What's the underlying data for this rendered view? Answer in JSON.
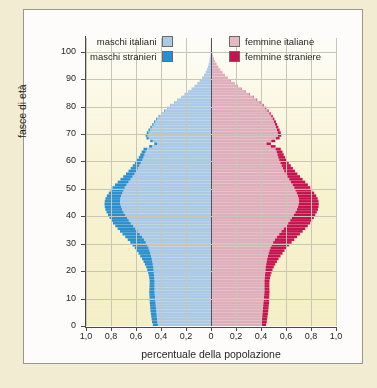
{
  "chart_data": {
    "type": "bar",
    "orientation": "horizontal",
    "subtype": "population-pyramid",
    "title": "",
    "xlabel": "percentuale della popolazione",
    "ylabel": "fasce di età",
    "xtick_labels": [
      "1,0",
      "0,8",
      "0,6",
      "0,4",
      "0,2",
      "0",
      "0,2",
      "0,4",
      "0,6",
      "0,8",
      "1,0"
    ],
    "xtick_values": [
      -1.0,
      -0.8,
      -0.6,
      -0.4,
      -0.2,
      0,
      0.2,
      0.4,
      0.6,
      0.8,
      1.0
    ],
    "ytick_labels": [
      "0",
      "10",
      "20",
      "30",
      "40",
      "50",
      "60",
      "70",
      "80",
      "90",
      "100"
    ],
    "ytick_values": [
      0,
      10,
      20,
      30,
      40,
      50,
      60,
      70,
      80,
      90,
      100
    ],
    "xlim": [
      -1.0,
      1.0
    ],
    "ylim": [
      0,
      105
    ],
    "grid": true,
    "legend_position": "top",
    "ages": [
      0,
      1,
      2,
      3,
      4,
      5,
      6,
      7,
      8,
      9,
      10,
      11,
      12,
      13,
      14,
      15,
      16,
      17,
      18,
      19,
      20,
      21,
      22,
      23,
      24,
      25,
      26,
      27,
      28,
      29,
      30,
      31,
      32,
      33,
      34,
      35,
      36,
      37,
      38,
      39,
      40,
      41,
      42,
      43,
      44,
      45,
      46,
      47,
      48,
      49,
      50,
      51,
      52,
      53,
      54,
      55,
      56,
      57,
      58,
      59,
      60,
      61,
      62,
      63,
      64,
      65,
      66,
      67,
      68,
      69,
      70,
      71,
      72,
      73,
      74,
      75,
      76,
      77,
      78,
      79,
      80,
      81,
      82,
      83,
      84,
      85,
      86,
      87,
      88,
      89,
      90,
      91,
      92,
      93,
      94,
      95,
      96,
      97,
      98,
      99,
      100,
      101,
      102,
      103,
      104
    ],
    "series": [
      {
        "name": "maschi italiani",
        "side": "left",
        "color": "#a9c9e6",
        "values": [
          0.425,
          0.43,
          0.432,
          0.434,
          0.436,
          0.438,
          0.44,
          0.442,
          0.444,
          0.446,
          0.448,
          0.45,
          0.452,
          0.452,
          0.452,
          0.452,
          0.452,
          0.454,
          0.456,
          0.458,
          0.46,
          0.462,
          0.466,
          0.47,
          0.474,
          0.48,
          0.486,
          0.492,
          0.5,
          0.51,
          0.522,
          0.536,
          0.552,
          0.57,
          0.588,
          0.606,
          0.624,
          0.642,
          0.658,
          0.672,
          0.686,
          0.7,
          0.712,
          0.72,
          0.726,
          0.728,
          0.726,
          0.72,
          0.71,
          0.7,
          0.69,
          0.676,
          0.66,
          0.644,
          0.628,
          0.612,
          0.598,
          0.586,
          0.574,
          0.562,
          0.55,
          0.54,
          0.532,
          0.524,
          0.512,
          0.47,
          0.432,
          0.466,
          0.498,
          0.508,
          0.5,
          0.488,
          0.474,
          0.46,
          0.446,
          0.43,
          0.412,
          0.392,
          0.37,
          0.346,
          0.32,
          0.292,
          0.264,
          0.236,
          0.208,
          0.18,
          0.154,
          0.13,
          0.108,
          0.088,
          0.07,
          0.055,
          0.042,
          0.032,
          0.024,
          0.018,
          0.013,
          0.009,
          0.006,
          0.004,
          0.003,
          0.002,
          0.0015,
          0.001,
          0.0006
        ]
      },
      {
        "name": "maschi stranieri",
        "side": "left",
        "color": "#2a8fd0",
        "values": [
          0.04,
          0.042,
          0.043,
          0.044,
          0.045,
          0.046,
          0.046,
          0.046,
          0.046,
          0.045,
          0.044,
          0.043,
          0.042,
          0.041,
          0.04,
          0.039,
          0.039,
          0.04,
          0.042,
          0.045,
          0.05,
          0.056,
          0.063,
          0.07,
          0.078,
          0.086,
          0.094,
          0.102,
          0.11,
          0.118,
          0.124,
          0.13,
          0.134,
          0.138,
          0.14,
          0.141,
          0.142,
          0.142,
          0.141,
          0.14,
          0.138,
          0.136,
          0.133,
          0.13,
          0.126,
          0.122,
          0.118,
          0.113,
          0.108,
          0.103,
          0.098,
          0.092,
          0.086,
          0.08,
          0.074,
          0.068,
          0.062,
          0.057,
          0.052,
          0.047,
          0.042,
          0.038,
          0.034,
          0.031,
          0.028,
          0.025,
          0.022,
          0.02,
          0.018,
          0.016,
          0.014,
          0.012,
          0.011,
          0.01,
          0.009,
          0.008,
          0.007,
          0.006,
          0.005,
          0.004,
          0.004,
          0.003,
          0.003,
          0.002,
          0.002,
          0.002,
          0.001,
          0.001,
          0.001,
          0.001,
          0.001,
          0.001,
          0.0005,
          0.0005,
          0.0004,
          0.0003,
          0.0002,
          0.0002,
          0.0001,
          0.0001,
          0.0001,
          0.0001,
          0.0001,
          0.0001,
          0.0001
        ]
      },
      {
        "name": "femmine italiane",
        "side": "right",
        "color": "#dfaebd",
        "values": [
          0.402,
          0.406,
          0.408,
          0.41,
          0.412,
          0.414,
          0.416,
          0.418,
          0.42,
          0.422,
          0.424,
          0.426,
          0.428,
          0.428,
          0.428,
          0.428,
          0.428,
          0.43,
          0.432,
          0.434,
          0.436,
          0.438,
          0.442,
          0.446,
          0.45,
          0.456,
          0.462,
          0.468,
          0.476,
          0.486,
          0.498,
          0.512,
          0.528,
          0.546,
          0.564,
          0.582,
          0.6,
          0.618,
          0.634,
          0.648,
          0.662,
          0.676,
          0.688,
          0.696,
          0.702,
          0.704,
          0.702,
          0.696,
          0.686,
          0.676,
          0.666,
          0.654,
          0.64,
          0.626,
          0.612,
          0.598,
          0.586,
          0.576,
          0.566,
          0.556,
          0.546,
          0.538,
          0.532,
          0.526,
          0.516,
          0.478,
          0.444,
          0.482,
          0.52,
          0.536,
          0.534,
          0.528,
          0.52,
          0.512,
          0.504,
          0.494,
          0.482,
          0.468,
          0.452,
          0.434,
          0.414,
          0.39,
          0.364,
          0.336,
          0.306,
          0.274,
          0.244,
          0.214,
          0.186,
          0.158,
          0.132,
          0.11,
          0.09,
          0.072,
          0.056,
          0.043,
          0.032,
          0.023,
          0.016,
          0.011,
          0.008,
          0.005,
          0.0035,
          0.002,
          0.0012
        ]
      },
      {
        "name": "femmine straniere",
        "side": "right",
        "color": "#c5134f",
        "values": [
          0.038,
          0.04,
          0.041,
          0.042,
          0.043,
          0.044,
          0.044,
          0.044,
          0.044,
          0.043,
          0.042,
          0.041,
          0.04,
          0.039,
          0.039,
          0.039,
          0.04,
          0.042,
          0.045,
          0.05,
          0.056,
          0.064,
          0.072,
          0.081,
          0.09,
          0.1,
          0.11,
          0.12,
          0.13,
          0.139,
          0.147,
          0.154,
          0.16,
          0.165,
          0.169,
          0.172,
          0.174,
          0.175,
          0.175,
          0.174,
          0.172,
          0.17,
          0.167,
          0.164,
          0.16,
          0.156,
          0.151,
          0.146,
          0.14,
          0.134,
          0.128,
          0.121,
          0.114,
          0.107,
          0.1,
          0.093,
          0.086,
          0.079,
          0.072,
          0.066,
          0.06,
          0.055,
          0.05,
          0.046,
          0.042,
          0.038,
          0.035,
          0.032,
          0.029,
          0.026,
          0.024,
          0.021,
          0.019,
          0.017,
          0.015,
          0.013,
          0.012,
          0.01,
          0.009,
          0.008,
          0.007,
          0.006,
          0.005,
          0.004,
          0.004,
          0.003,
          0.003,
          0.002,
          0.002,
          0.002,
          0.001,
          0.001,
          0.001,
          0.001,
          0.0008,
          0.0006,
          0.0004,
          0.0003,
          0.0002,
          0.0002,
          0.0001,
          0.0001,
          0.0001,
          0.0001,
          0.0001
        ]
      }
    ]
  },
  "axes": {
    "y_title": "fasce di età",
    "x_title": "percentuale della popolazione",
    "y_labels": [
      "100",
      "90",
      "80",
      "70",
      "60",
      "50",
      "40",
      "30",
      "20",
      "10",
      "0"
    ],
    "x_labels": [
      "1,0",
      "0,8",
      "0,6",
      "0,4",
      "0,2",
      "0",
      "0,2",
      "0,4",
      "0,6",
      "0,8",
      "1,0"
    ]
  },
  "legend": {
    "left": [
      {
        "label": "maschi italiani",
        "color": "#a9c9e6"
      },
      {
        "label": "maschi stranieri",
        "color": "#2a8fd0"
      }
    ],
    "right": [
      {
        "label": "femmine italiane",
        "color": "#e5b9c6"
      },
      {
        "label": "femmine straniere",
        "color": "#c5134f"
      }
    ]
  },
  "colors": {
    "page_background": "#f2ecd2",
    "card_background": "#fdfcfa",
    "plot_background": "#f7f2ce",
    "grid": "#c8c6b4",
    "axis": "#4b4a46",
    "male_native": "#a9c9e6",
    "male_foreign": "#2a8fd0",
    "female_native": "#dfaebd",
    "female_foreign": "#c5134f"
  }
}
